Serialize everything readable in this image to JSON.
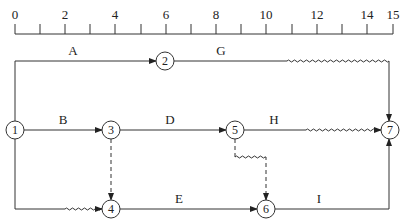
{
  "scale": {
    "labels": [
      "0",
      "2",
      "4",
      "6",
      "8",
      "10",
      "12",
      "14",
      "15"
    ],
    "label_positions": [
      0,
      2,
      4,
      6,
      8,
      10,
      12,
      14,
      15
    ],
    "ticks": [
      0,
      1,
      2,
      3,
      4,
      5,
      6,
      7,
      8,
      9,
      10,
      11,
      12,
      13,
      14,
      15
    ]
  },
  "nodes": [
    {
      "id": "1",
      "label": "1"
    },
    {
      "id": "2",
      "label": "2"
    },
    {
      "id": "3",
      "label": "3"
    },
    {
      "id": "4",
      "label": "4"
    },
    {
      "id": "5",
      "label": "5"
    },
    {
      "id": "6",
      "label": "6"
    },
    {
      "id": "7",
      "label": "7"
    }
  ],
  "activities": [
    {
      "label": "A",
      "from": "1",
      "to": "2"
    },
    {
      "label": "G",
      "from": "2",
      "to": "7",
      "free_float": true
    },
    {
      "label": "B",
      "from": "1",
      "to": "3"
    },
    {
      "label": "D",
      "from": "3",
      "to": "5"
    },
    {
      "label": "H",
      "from": "5",
      "to": "7",
      "free_float": true
    },
    {
      "label": "E",
      "from": "4",
      "to": "6"
    },
    {
      "label": "I",
      "from": "6",
      "to": "7"
    },
    {
      "label": "",
      "from": "1",
      "to": "4",
      "free_float": true
    },
    {
      "label": "",
      "from": "3",
      "to": "4",
      "dummy": true
    },
    {
      "label": "",
      "from": "5",
      "to": "6",
      "dummy": true,
      "free_float": true
    }
  ]
}
